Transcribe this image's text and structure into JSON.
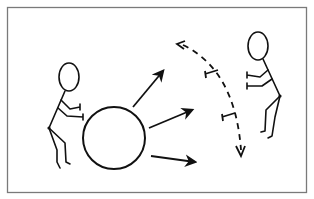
{
  "diagram": {
    "title": "",
    "colors": {
      "stroke": "#111111",
      "frame": "#7a7a7a",
      "background": "#ffffff"
    },
    "elements": {
      "frame": {
        "x": 7,
        "y": 7,
        "width": 299,
        "height": 185
      },
      "left_figure": {
        "role": "pusher",
        "head": {
          "cx": 69,
          "cy": 78,
          "rx": 10,
          "ry": 14
        }
      },
      "ball": {
        "cx": 114,
        "cy": 138,
        "r": 31
      },
      "ball_arrows": [
        {
          "from": [
            133,
            107
          ],
          "to": [
            163,
            70
          ]
        },
        {
          "from": [
            148,
            128
          ],
          "to": [
            192,
            110
          ]
        },
        {
          "from": [
            151,
            156
          ],
          "to": [
            196,
            162
          ]
        }
      ],
      "right_figure": {
        "role": "receiver",
        "head": {
          "cx": 258,
          "cy": 46,
          "rx": 10,
          "ry": 14
        }
      },
      "dashed_arc": {
        "start": [
          179,
          44
        ],
        "end": [
          241,
          155
        ],
        "tick_markers": 2
      }
    }
  }
}
